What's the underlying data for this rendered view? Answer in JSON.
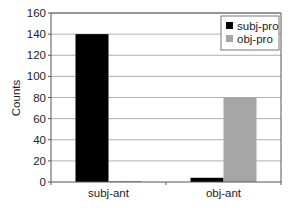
{
  "chart_data": {
    "type": "bar",
    "title": "",
    "xlabel": "",
    "ylabel": "Counts",
    "ylim": [
      0,
      160
    ],
    "yticks": [
      0,
      20,
      40,
      60,
      80,
      100,
      120,
      140,
      160
    ],
    "grid": true,
    "legend_position": "upper right",
    "categories": [
      "subj-ant",
      "obj-ant"
    ],
    "series": [
      {
        "name": "subj-pro",
        "color": "#000000",
        "values": [
          140,
          4
        ]
      },
      {
        "name": "obj-pro",
        "color": "#a6a6a6",
        "values": [
          1,
          80
        ]
      }
    ]
  }
}
